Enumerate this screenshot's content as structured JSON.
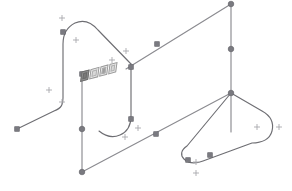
{
  "app": {
    "title": "3D Sketch Viewport",
    "background_color": "#ffffff",
    "curve_color": "#6e6e73",
    "node_color": "#7a7a80",
    "marker_color": "#a8a8ad",
    "widget_border_color": "#9a9a9a"
  },
  "viewport": {
    "name": "isometric-sketch-viewport",
    "width": 292,
    "height": 191,
    "projection": "isometric"
  },
  "toolbar": {
    "name": "floating-context-toolbar",
    "x": 80,
    "y": 70,
    "buttons": [
      {
        "icon": "select-tool-icon",
        "label": "Select",
        "active": true
      },
      {
        "icon": "dimension-tool-icon",
        "label": "Dimension",
        "active": false
      },
      {
        "icon": "constraint-tool-icon",
        "label": "Constraint",
        "active": false
      },
      {
        "icon": "options-tool-icon",
        "label": "Options",
        "active": false
      }
    ]
  },
  "geometry": {
    "curves": [
      {
        "name": "left-swept-profile",
        "id": "curve-left-profile",
        "path": "M 17 129 L 54 111 C 62 108 63 104 63 98 L 63 44 C 63 34 67 27 75 23 C 84 19 92 23 98 30 L 131 64",
        "stroke": "#6e6e73"
      },
      {
        "name": "center-vertical-edge",
        "id": "curve-center-vertical",
        "path": "M 82 74 L 82 172",
        "stroke": "#8b8b90"
      },
      {
        "name": "center-swept-profile",
        "id": "curve-center-profile",
        "path": "M 131 64 L 131 116 C 131 126 127 132 120 135 C 113 138 105 136 99 131",
        "stroke": "#6e6e73"
      },
      {
        "name": "top-diagonal-edge",
        "id": "curve-top-diagonal",
        "path": "M 126 69 L 231 4",
        "stroke": "#8b8b90"
      },
      {
        "name": "right-vertical-edge",
        "id": "curve-right-vertical",
        "path": "M 231 4 L 231 132",
        "stroke": "#8b8b90"
      },
      {
        "name": "bottom-diagonal-edge",
        "id": "curve-bottom-diagonal",
        "path": "M 82 172 L 231 93",
        "stroke": "#8b8b90"
      },
      {
        "name": "right-rounded-panel",
        "id": "curve-right-panel",
        "path": "M 231 93 L 262 111 C 271 116 274 123 272 131 C 270 139 262 143 252 143 L 203 161 C 195 164 188 163 184 159 C 180 155 181 150 187 146 L 231 93",
        "stroke": "#6e6e73"
      }
    ],
    "nodes": [
      {
        "name": "node-left-endpoint",
        "shape": "square",
        "x": 17,
        "y": 129
      },
      {
        "name": "node-left-profile-bend",
        "shape": "square",
        "x": 63,
        "y": 32
      },
      {
        "name": "node-center-vertical-top",
        "shape": "square",
        "x": 82,
        "y": 74
      },
      {
        "name": "node-center-vertical-mid",
        "shape": "circle",
        "x": 82,
        "y": 129
      },
      {
        "name": "node-center-vertical-bottom",
        "shape": "circle",
        "x": 82,
        "y": 172
      },
      {
        "name": "node-center-profile-top",
        "shape": "square",
        "x": 131,
        "y": 67
      },
      {
        "name": "node-center-profile-mid",
        "shape": "square",
        "x": 131,
        "y": 119
      },
      {
        "name": "node-top-diagonal-mid",
        "shape": "square",
        "x": 157,
        "y": 44
      },
      {
        "name": "node-top-diagonal-right",
        "shape": "circle",
        "x": 231,
        "y": 4
      },
      {
        "name": "node-right-vertical-mid",
        "shape": "circle",
        "x": 231,
        "y": 49
      },
      {
        "name": "node-panel-corner",
        "shape": "circle",
        "x": 231,
        "y": 93
      },
      {
        "name": "node-bottom-diagonal-mid",
        "shape": "square",
        "x": 156,
        "y": 134
      },
      {
        "name": "node-panel-bottom-left",
        "shape": "square",
        "x": 188,
        "y": 160
      },
      {
        "name": "node-panel-bottom-right",
        "shape": "square",
        "x": 210,
        "y": 155
      }
    ],
    "markers": [
      {
        "name": "constraint-marker",
        "x": 62,
        "y": 18
      },
      {
        "name": "constraint-marker",
        "x": 76,
        "y": 40
      },
      {
        "name": "constraint-marker",
        "x": 49,
        "y": 90
      },
      {
        "name": "constraint-marker",
        "x": 62,
        "y": 102
      },
      {
        "name": "constraint-marker",
        "x": 112,
        "y": 60
      },
      {
        "name": "constraint-marker",
        "x": 126,
        "y": 51
      },
      {
        "name": "constraint-marker",
        "x": 125,
        "y": 137
      },
      {
        "name": "constraint-marker",
        "x": 138,
        "y": 128
      },
      {
        "name": "constraint-marker",
        "x": 196,
        "y": 162
      },
      {
        "name": "constraint-marker",
        "x": 196,
        "y": 173
      },
      {
        "name": "constraint-marker",
        "x": 257,
        "y": 127
      },
      {
        "name": "constraint-marker",
        "x": 279,
        "y": 127
      }
    ]
  }
}
